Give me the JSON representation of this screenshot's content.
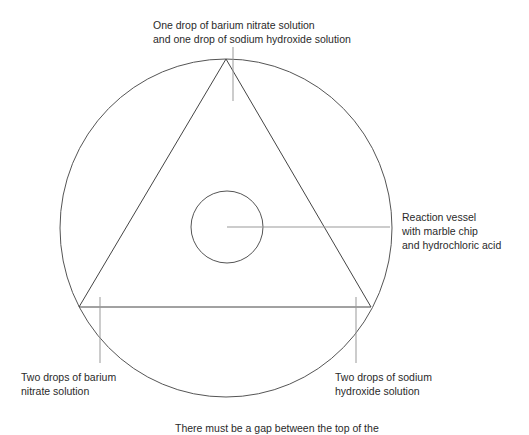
{
  "labels": {
    "top": [
      "One drop of barium nitrate solution",
      "and one drop of sodium hydroxide solution"
    ],
    "vessel": [
      "Reaction vessel",
      "with marble chip",
      "and hydrochloric acid"
    ],
    "bottom_left": [
      "Two drops of barium",
      "nitrate solution"
    ],
    "bottom_right": [
      "Two drops of sodium",
      "hydroxide solution"
    ],
    "caption": "There must be a gap between the top of the"
  },
  "colors": {
    "outline": "#444444",
    "leader": "#999999"
  }
}
